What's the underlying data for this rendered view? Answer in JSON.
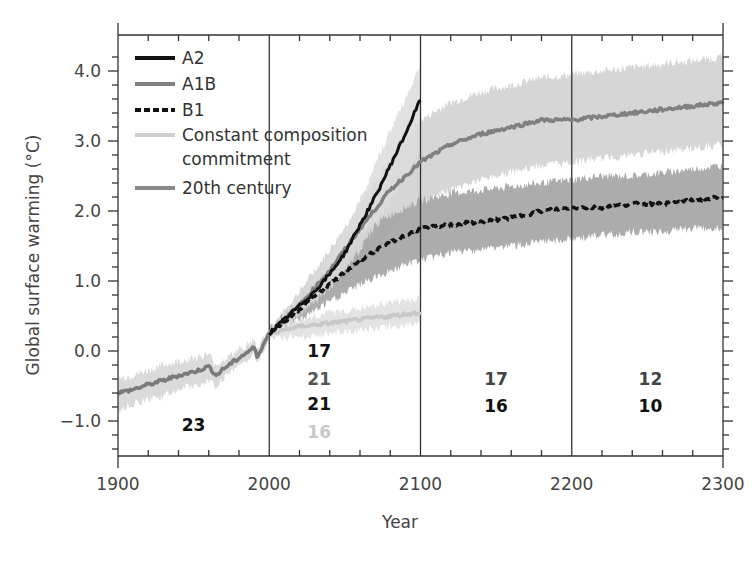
{
  "chart_data": {
    "type": "line",
    "title": "",
    "xlabel": "Year",
    "ylabel": "Global surface warming (°C)",
    "xlim": [
      1900,
      2300
    ],
    "ylim": [
      -1.5,
      4.5
    ],
    "x_ticks": [
      1900,
      2000,
      2100,
      2200,
      2300
    ],
    "x_tick_labels": [
      "1900",
      "2000",
      "2100",
      "2200",
      "2300"
    ],
    "y_ticks": [
      -1.0,
      0.0,
      1.0,
      2.0,
      3.0,
      4.0
    ],
    "y_tick_labels": [
      "−1.0",
      "0.0",
      "1.0",
      "2.0",
      "3.0",
      "4.0"
    ],
    "vertical_dividers": [
      2000,
      2100,
      2200
    ],
    "grid": false,
    "legend_position": "upper left",
    "series": [
      {
        "name": "A2",
        "color": "#111111",
        "style": "solid",
        "x": [
          2000,
          2010,
          2020,
          2030,
          2040,
          2050,
          2060,
          2070,
          2080,
          2090,
          2100
        ],
        "values": [
          0.25,
          0.45,
          0.65,
          0.85,
          1.1,
          1.4,
          1.8,
          2.2,
          2.65,
          3.1,
          3.6
        ],
        "band_low": [
          0.2,
          0.35,
          0.5,
          0.7,
          0.9,
          1.15,
          1.45,
          1.8,
          2.15,
          2.5,
          2.9
        ],
        "band_high": [
          0.3,
          0.55,
          0.8,
          1.05,
          1.35,
          1.7,
          2.15,
          2.65,
          3.15,
          3.6,
          4.1
        ]
      },
      {
        "name": "A1B",
        "color": "#808080",
        "style": "solid",
        "x": [
          2000,
          2020,
          2040,
          2060,
          2080,
          2100,
          2120,
          2140,
          2160,
          2180,
          2200,
          2220,
          2240,
          2260,
          2280,
          2300
        ],
        "values": [
          0.25,
          0.65,
          1.15,
          1.75,
          2.3,
          2.7,
          2.95,
          3.1,
          3.2,
          3.3,
          3.3,
          3.35,
          3.4,
          3.45,
          3.5,
          3.55
        ],
        "band_low": [
          0.2,
          0.5,
          0.85,
          1.25,
          1.7,
          2.1,
          2.3,
          2.45,
          2.55,
          2.65,
          2.7,
          2.75,
          2.8,
          2.85,
          2.9,
          2.95
        ],
        "band_high": [
          0.3,
          0.85,
          1.45,
          2.1,
          2.75,
          3.3,
          3.55,
          3.7,
          3.8,
          3.9,
          3.95,
          4.0,
          4.05,
          4.1,
          4.15,
          4.2
        ]
      },
      {
        "name": "B1",
        "color": "#111111",
        "style": "dashed",
        "x": [
          2000,
          2020,
          2040,
          2060,
          2080,
          2100,
          2120,
          2140,
          2160,
          2180,
          2200,
          2220,
          2240,
          2260,
          2280,
          2300
        ],
        "values": [
          0.25,
          0.6,
          0.95,
          1.3,
          1.55,
          1.75,
          1.8,
          1.85,
          1.9,
          2.0,
          2.05,
          2.05,
          2.1,
          2.1,
          2.15,
          2.2
        ],
        "band_low": [
          0.2,
          0.45,
          0.7,
          0.95,
          1.15,
          1.3,
          1.4,
          1.45,
          1.5,
          1.55,
          1.6,
          1.65,
          1.7,
          1.7,
          1.75,
          1.75
        ],
        "band_high": [
          0.3,
          0.75,
          1.2,
          1.65,
          1.95,
          2.15,
          2.25,
          2.3,
          2.35,
          2.4,
          2.45,
          2.5,
          2.5,
          2.55,
          2.6,
          2.65
        ]
      },
      {
        "name": "Constant composition commitment",
        "color": "#c8c8c8",
        "style": "solid",
        "x": [
          2000,
          2020,
          2040,
          2060,
          2080,
          2100
        ],
        "values": [
          0.25,
          0.35,
          0.4,
          0.45,
          0.5,
          0.55
        ],
        "band_low": [
          0.2,
          0.2,
          0.25,
          0.3,
          0.35,
          0.4
        ],
        "band_high": [
          0.3,
          0.45,
          0.55,
          0.6,
          0.7,
          0.75
        ]
      },
      {
        "name": "20th century",
        "color": "#7a7a7a",
        "style": "solid",
        "x": [
          1900,
          1910,
          1920,
          1930,
          1940,
          1950,
          1960,
          1965,
          1970,
          1980,
          1990,
          1992,
          1995,
          2000
        ],
        "values": [
          -0.6,
          -0.55,
          -0.48,
          -0.42,
          -0.35,
          -0.3,
          -0.22,
          -0.35,
          -0.25,
          -0.1,
          0.05,
          -0.08,
          0.05,
          0.25
        ],
        "band_low": [
          -0.85,
          -0.75,
          -0.7,
          -0.65,
          -0.55,
          -0.5,
          -0.42,
          -0.5,
          -0.4,
          -0.22,
          -0.05,
          -0.18,
          -0.05,
          0.18
        ],
        "band_high": [
          -0.4,
          -0.35,
          -0.28,
          -0.2,
          -0.15,
          -0.1,
          -0.05,
          -0.2,
          -0.12,
          0.02,
          0.15,
          0.02,
          0.15,
          0.32
        ]
      }
    ],
    "annotations": [
      {
        "text": "23",
        "x": 1950,
        "y": -1.05,
        "color": "#111111"
      },
      {
        "text": "17",
        "x": 2033,
        "y": 0.0,
        "color": "#111111"
      },
      {
        "text": "21",
        "x": 2033,
        "y": -0.4,
        "color": "#555555"
      },
      {
        "text": "21",
        "x": 2033,
        "y": -0.75,
        "color": "#111111"
      },
      {
        "text": "16",
        "x": 2033,
        "y": -1.15,
        "color": "#c8c8c8"
      },
      {
        "text": "17",
        "x": 2150,
        "y": -0.4,
        "color": "#444444"
      },
      {
        "text": "16",
        "x": 2150,
        "y": -0.78,
        "color": "#111111"
      },
      {
        "text": "12",
        "x": 2252,
        "y": -0.4,
        "color": "#444444"
      },
      {
        "text": "10",
        "x": 2252,
        "y": -0.78,
        "color": "#111111"
      }
    ]
  },
  "legend": {
    "items": [
      {
        "label": "A2",
        "style": "solid",
        "color": "#111111"
      },
      {
        "label": "A1B",
        "style": "solid",
        "color": "#808080"
      },
      {
        "label": "B1",
        "style": "dashed",
        "color": "#111111"
      },
      {
        "label": "Constant composition",
        "label2": "commitment",
        "style": "solid",
        "color": "#cfcfcf"
      },
      {
        "label": "20th century",
        "style": "solid",
        "color": "#8a8a8a"
      }
    ]
  },
  "colors": {
    "axis": "#333333",
    "band_a1b": "#d4d4d4",
    "band_b1": "#a8a8a8",
    "band_a2": "#dcdcdc",
    "band_const": "#e2e2e2",
    "band_20c": "#d8d8d8"
  }
}
